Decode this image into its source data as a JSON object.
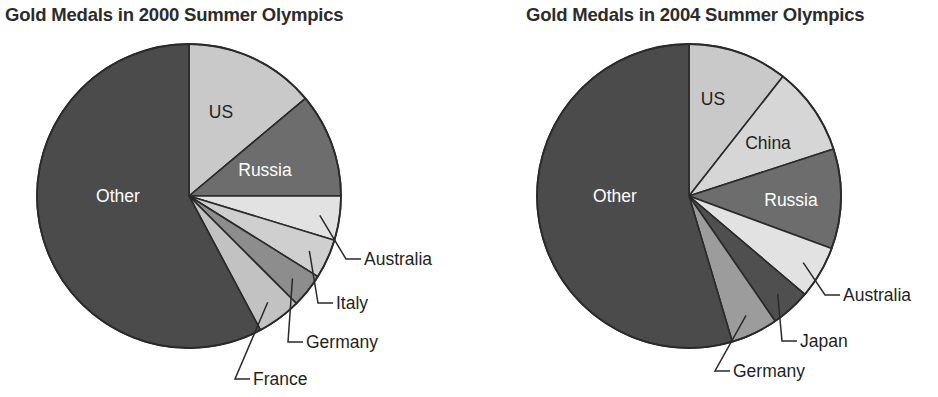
{
  "chart_data": [
    {
      "type": "pie",
      "title": "Gold Medals in 2000 Summer Olympics",
      "legend_position": "none",
      "grid": false,
      "categories": [
        "US",
        "Russia",
        "Australia",
        "Italy",
        "Germany",
        "France",
        "Other"
      ],
      "values": [
        13.9,
        11.1,
        4.7,
        4.2,
        3.6,
        4.7,
        57.8
      ],
      "colors": [
        "#c9c9c9",
        "#6d6d6d",
        "#e2e2e2",
        "#cfcfcf",
        "#8d8d8d",
        "#c2c2c2",
        "#4b4b4b"
      ],
      "label_placement": [
        "inside",
        "inside",
        "callout",
        "callout",
        "callout",
        "callout",
        "inside"
      ],
      "inside_labels": [
        {
          "name": "US",
          "text": "US",
          "x": 221,
          "y": 112,
          "color": "#1f1f1f"
        },
        {
          "name": "Russia",
          "text": "Russia",
          "x": 265,
          "y": 170,
          "color": "#ffffff"
        },
        {
          "name": "Other",
          "text": "Other",
          "x": 118,
          "y": 196,
          "color": "#ffffff"
        }
      ],
      "callouts": [
        {
          "name": "Australia",
          "text": "Australia",
          "x": 364,
          "y": 259
        },
        {
          "name": "Italy",
          "text": "Italy",
          "x": 336,
          "y": 303
        },
        {
          "name": "Germany",
          "text": "Germany",
          "x": 306,
          "y": 342
        },
        {
          "name": "France",
          "text": "France",
          "x": 253,
          "y": 379
        }
      ]
    },
    {
      "type": "pie",
      "title": "Gold Medals in 2004 Summer Olympics",
      "legend_position": "none",
      "grid": false,
      "categories": [
        "US",
        "China",
        "Russia",
        "Australia",
        "Japan",
        "Germany",
        "Other"
      ],
      "values": [
        10.6,
        9.4,
        10.6,
        5.6,
        4.2,
        5.0,
        54.6
      ],
      "colors": [
        "#c9c9c9",
        "#d6d6d6",
        "#6d6d6d",
        "#e2e2e2",
        "#4f4f4f",
        "#9c9c9c",
        "#4b4b4b"
      ],
      "label_placement": [
        "inside",
        "inside",
        "inside",
        "callout",
        "callout",
        "callout",
        "inside"
      ],
      "inside_labels": [
        {
          "name": "US",
          "text": "US",
          "x": 713,
          "y": 99,
          "color": "#1f1f1f"
        },
        {
          "name": "China",
          "text": "China",
          "x": 768,
          "y": 143,
          "color": "#1f1f1f"
        },
        {
          "name": "Russia",
          "text": "Russia",
          "x": 791,
          "y": 200,
          "color": "#ffffff"
        },
        {
          "name": "Other",
          "text": "Other",
          "x": 615,
          "y": 196,
          "color": "#ffffff"
        }
      ],
      "callouts": [
        {
          "name": "Australia",
          "text": "Australia",
          "x": 843,
          "y": 295
        },
        {
          "name": "Japan",
          "text": "Japan",
          "x": 800,
          "y": 341
        },
        {
          "name": "Germany",
          "text": "Germany",
          "x": 733,
          "y": 371
        }
      ]
    }
  ],
  "figures": {
    "left": {
      "title": "Gold Medals in 2000 Summer Olympics"
    },
    "right": {
      "title": "Gold Medals in 2004 Summer Olympics"
    }
  }
}
